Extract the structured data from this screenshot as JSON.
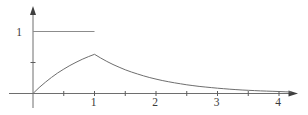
{
  "figure": {
    "background": "#ffffff",
    "axis_color": "#6e6e6e",
    "arrow_color": "#3f3f3f",
    "tick_color": "#5d5d5d",
    "label_color": "#3a3a3a",
    "curve_color": "#6e6e6e",
    "pulse_color": "#8c8c8c"
  },
  "chart_data": {
    "type": "line",
    "title": "",
    "xlabel": "",
    "ylabel": "",
    "xlim": [
      0,
      4.45
    ],
    "ylim": [
      0,
      1.4
    ],
    "grid": false,
    "legend": "none",
    "axes": {
      "x_ticks": [
        0.5,
        1,
        1.5,
        2,
        2.5,
        3,
        3.5,
        4
      ],
      "x_tick_labels": [
        {
          "value": 1,
          "label": "1"
        },
        {
          "value": 2,
          "label": "2"
        },
        {
          "value": 3,
          "label": "3"
        },
        {
          "value": 4,
          "label": "4"
        }
      ],
      "y_ticks": [
        0.5
      ],
      "y_tick_labels": [
        {
          "value": 1,
          "label": "1"
        }
      ]
    },
    "series": [
      {
        "name": "unit-pulse-input",
        "role": "pulse",
        "points": [
          [
            0,
            1
          ],
          [
            1,
            1
          ]
        ]
      },
      {
        "name": "response-curve",
        "role": "curve",
        "points": [
          [
            0,
            0
          ],
          [
            0.1,
            0.095
          ],
          [
            0.2,
            0.181
          ],
          [
            0.3,
            0.259
          ],
          [
            0.4,
            0.33
          ],
          [
            0.5,
            0.393
          ],
          [
            0.6,
            0.451
          ],
          [
            0.7,
            0.503
          ],
          [
            0.8,
            0.551
          ],
          [
            0.9,
            0.593
          ],
          [
            1,
            0.632
          ],
          [
            1.1,
            0.572
          ],
          [
            1.2,
            0.518
          ],
          [
            1.3,
            0.468
          ],
          [
            1.4,
            0.424
          ],
          [
            1.5,
            0.383
          ],
          [
            1.6,
            0.347
          ],
          [
            1.7,
            0.314
          ],
          [
            1.8,
            0.284
          ],
          [
            1.9,
            0.257
          ],
          [
            2,
            0.233
          ],
          [
            2.1,
            0.21
          ],
          [
            2.2,
            0.19
          ],
          [
            2.3,
            0.172
          ],
          [
            2.4,
            0.156
          ],
          [
            2.5,
            0.141
          ],
          [
            2.6,
            0.128
          ],
          [
            2.7,
            0.115
          ],
          [
            2.8,
            0.105
          ],
          [
            2.9,
            0.095
          ],
          [
            3,
            0.086
          ],
          [
            3.1,
            0.077
          ],
          [
            3.2,
            0.07
          ],
          [
            3.3,
            0.063
          ],
          [
            3.4,
            0.057
          ],
          [
            3.5,
            0.052
          ],
          [
            3.6,
            0.047
          ],
          [
            3.7,
            0.042
          ],
          [
            3.8,
            0.038
          ],
          [
            3.9,
            0.035
          ],
          [
            4,
            0.032
          ],
          [
            4.1,
            0.028
          ],
          [
            4.2,
            0.025
          ]
        ]
      }
    ]
  }
}
